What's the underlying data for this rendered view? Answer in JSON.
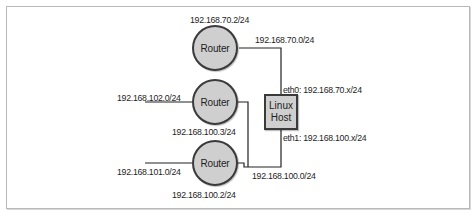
{
  "diagram": {
    "routers": [
      {
        "label": "Router",
        "address": "192.168.70.2/24"
      },
      {
        "label": "Router",
        "address": "192.168.100.3/24",
        "network": "192.168.102.0/24"
      },
      {
        "label": "Router",
        "address": "192.168.100.2/24",
        "network": "192.168.101.0/24"
      }
    ],
    "host": {
      "line1": "Linux",
      "line2": "Host"
    },
    "networks": {
      "upper": "192.168.70.0/24",
      "lower": "192.168.100.0/24"
    },
    "interfaces": {
      "eth0": "eth0: 192.168.70.x/24",
      "eth1": "eth1: 192.168.100.x/24"
    },
    "colors": {
      "node_fill": "#cfcfcf",
      "node_stroke": "#3a3a3a",
      "wire": "#222222"
    }
  }
}
